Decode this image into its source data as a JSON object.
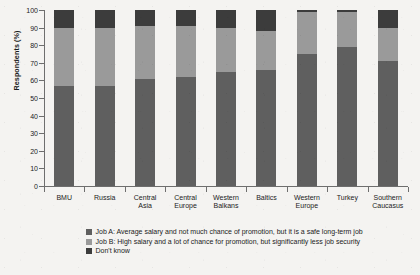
{
  "chart_data": {
    "type": "bar",
    "subtype": "stacked-bar-100-percent",
    "title": "",
    "xlabel": "",
    "ylabel": "Respondents (%)",
    "ylim": [
      0,
      100
    ],
    "y_ticks": [
      0,
      10,
      20,
      30,
      40,
      50,
      60,
      70,
      80,
      90,
      100
    ],
    "grid": false,
    "legend_position": "bottom",
    "categories": [
      "BMU",
      "Russia",
      "Central Asia",
      "Central Europe",
      "Western Balkans",
      "Baltics",
      "Western Europe",
      "Turkey",
      "Southern Caucasus"
    ],
    "category_lines": [
      [
        "BMU"
      ],
      [
        "Russia"
      ],
      [
        "Central",
        "Asia"
      ],
      [
        "Central",
        "Europe"
      ],
      [
        "Western",
        "Balkans"
      ],
      [
        "Baltics"
      ],
      [
        "Western",
        "Europe"
      ],
      [
        "Turkey"
      ],
      [
        "Southern",
        "Caucasus"
      ]
    ],
    "series": [
      {
        "name": "Job A: Average salary and not much chance of promotion, but it is a safe long-term job",
        "short_name": "Job A",
        "color": "#5f5f5f",
        "values": [
          57,
          57,
          61,
          62,
          65,
          66,
          75,
          79,
          71
        ]
      },
      {
        "name": "Job B: High salary and a lot of chance for promotion, but significantly less job security",
        "short_name": "Job B",
        "color": "#9a9a9a",
        "values": [
          33,
          33,
          30,
          29,
          25,
          22,
          24,
          20,
          19
        ]
      },
      {
        "name": "Don't know",
        "short_name": "Don't know",
        "color": "#3c3c3c",
        "values": [
          10,
          10,
          9,
          9,
          10,
          12,
          1,
          1,
          10
        ]
      }
    ]
  },
  "legend": {
    "items": [
      {
        "label": "Job A: Average salary and not much chance of promotion, but it is a safe long-term job",
        "color": "#5f5f5f"
      },
      {
        "label": "Job B: High salary and a lot of chance for promotion, but significantly less job security",
        "color": "#9a9a9a"
      },
      {
        "label": "Don't know",
        "color": "#3c3c3c"
      }
    ]
  },
  "axis": {
    "y_title": "Respondents (%)"
  }
}
